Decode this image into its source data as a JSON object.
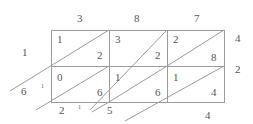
{
  "multiplicand_digits": [
    "3",
    "8",
    "7"
  ],
  "multiplier_digits": [
    "4",
    "2"
  ],
  "cells": [
    [
      {
        "tens": "1",
        "ones": "2"
      },
      {
        "tens": "3",
        "ones": "2"
      },
      {
        "tens": "2",
        "ones": "8"
      }
    ],
    [
      {
        "tens": "0",
        "ones": "6"
      },
      {
        "tens": "1",
        "ones": "6"
      },
      {
        "tens": "1",
        "ones": "4"
      }
    ]
  ],
  "result_digits": {
    "left_1": "1",
    "left_2": "6",
    "bottom_1": "2",
    "bottom_2": "5",
    "bottom_3": "4"
  },
  "carries": {
    "left_carry": "1",
    "bottom_carry": "1"
  },
  "colors": {
    "line": "#999999",
    "text": "#555555"
  }
}
